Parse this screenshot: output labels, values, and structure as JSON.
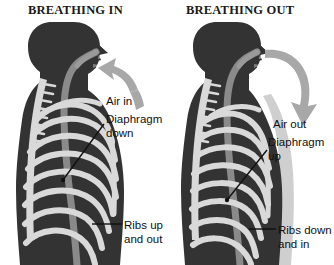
{
  "figure": {
    "background_color": "#ffffff",
    "body_color": "#333333",
    "bone_color": "#d9d9d9",
    "airway_color": "#808080",
    "arrow_color": "#a8a8a8",
    "text_color": "#111111",
    "title_color": "#1a1a1a",
    "skin_highlight_color": "#cfcfcf"
  },
  "panels": [
    {
      "id": "breathing-in",
      "title": "BREATHING IN",
      "arrow": {
        "name": "air-in-arrow",
        "direction": "in-toward-mouth"
      },
      "labels": {
        "air": "Air in",
        "diaphragm_line1": "Diaphragm",
        "diaphragm_line2": "down",
        "ribs_line1": "Ribs up",
        "ribs_line2": "and out"
      }
    },
    {
      "id": "breathing-out",
      "title": "BREATHING OUT",
      "arrow": {
        "name": "air-out-arrow",
        "direction": "out-away-from-mouth"
      },
      "labels": {
        "air": "Air out",
        "diaphragm_line1": "Diaphragm",
        "diaphragm_line2": "up",
        "ribs_line1": "Ribs down",
        "ribs_line2": "and in"
      }
    }
  ]
}
